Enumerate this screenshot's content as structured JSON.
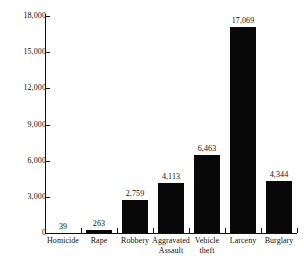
{
  "chart_data": {
    "type": "bar",
    "title": "",
    "subtitle": "",
    "xlabel": "",
    "ylabel": "",
    "categories": [
      "Homicide",
      "Rape",
      "Robbery",
      "Aggravated Assault",
      "Vehicle theft",
      "Larceny",
      "Burglary"
    ],
    "category_lines": [
      [
        "Homicide"
      ],
      [
        "Rape"
      ],
      [
        "Robbery"
      ],
      [
        "Aggravated",
        "Assault"
      ],
      [
        "Vehicle",
        "theft"
      ],
      [
        "Larceny"
      ],
      [
        "Burglary"
      ]
    ],
    "values": [
      39,
      263,
      2759,
      4113,
      6463,
      17069,
      4344
    ],
    "value_labels": [
      "39",
      "263",
      "2,759",
      "4,113",
      "6,463",
      "17,069",
      "4,344"
    ],
    "ylim": [
      0,
      18000
    ],
    "ytick_values": [
      0,
      3000,
      6000,
      9000,
      12000,
      15000,
      18000
    ],
    "ytick_labels": [
      "0",
      "3,000",
      "6,000",
      "9,000",
      "12,000",
      "15,000",
      "18,000"
    ],
    "grid": false,
    "legend": false,
    "legend_position": "none",
    "bar_color": "#080808",
    "background_color": "#ffffff",
    "axis_color": "#111111"
  }
}
